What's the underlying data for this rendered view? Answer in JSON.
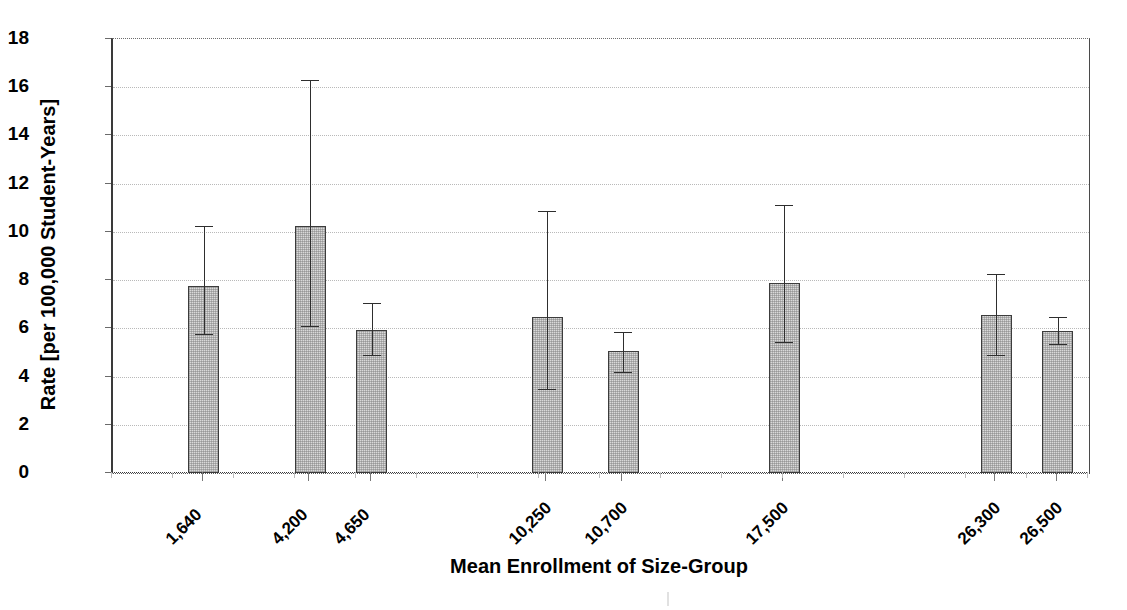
{
  "chart_data": {
    "type": "bar",
    "title": "",
    "subtitle": "",
    "xlabel": "Mean Enrollment of Size-Group",
    "ylabel": "Rate [per 100,000 Student-Years]",
    "categories": [
      "1,640",
      "4,200",
      "4,650",
      "10,250",
      "10,700",
      "17,500",
      "26,300",
      "26,500"
    ],
    "values": [
      7.75,
      10.25,
      5.95,
      6.45,
      5.05,
      7.9,
      6.55,
      5.9
    ],
    "error_low": [
      5.75,
      6.1,
      4.9,
      3.5,
      4.2,
      5.45,
      4.9,
      5.35
    ],
    "error_high": [
      10.25,
      16.3,
      7.05,
      10.85,
      5.85,
      11.1,
      8.25,
      6.45
    ],
    "x_positions": [
      0.093,
      0.202,
      0.265,
      0.445,
      0.523,
      0.688,
      0.905,
      0.968
    ],
    "ylim": [
      0,
      18
    ],
    "yticks": [
      0,
      2,
      4,
      6,
      8,
      10,
      12,
      14,
      16,
      18
    ],
    "ytick_labels": [
      "0",
      "2",
      "4",
      "6",
      "8",
      "10",
      "12",
      "14",
      "16",
      "18"
    ],
    "grid": true,
    "legend": "none",
    "bar_color": "#d9d9d9",
    "bar_edge_color": "#3c3c3c",
    "error_color": "#2e2e2e"
  }
}
